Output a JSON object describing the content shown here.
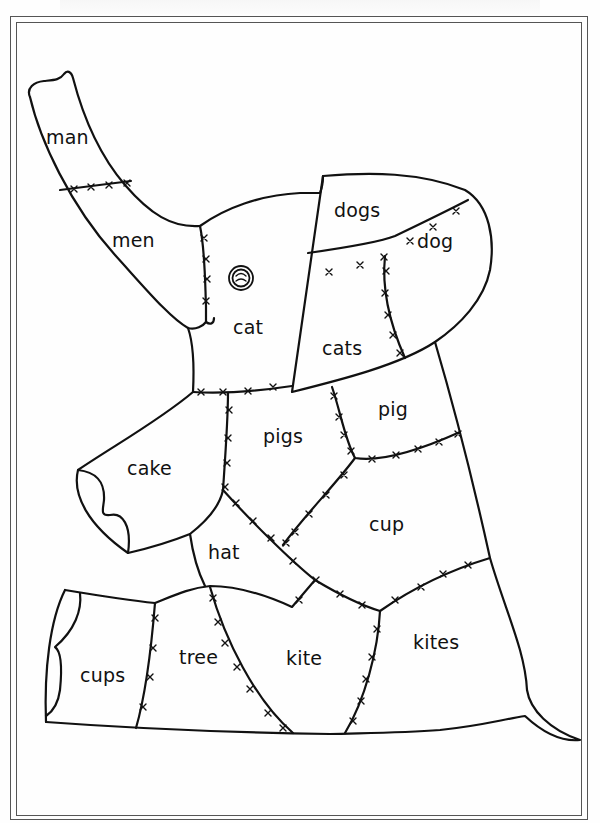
{
  "worksheet": {
    "title": "Patchwork elephant coloring worksheet",
    "figure": "elephant",
    "ink_color": "#111111",
    "paper_color": "#fefefe",
    "frame_color": "#555555"
  },
  "patches": [
    {
      "id": "trunk-tip",
      "word": "man",
      "x": 46,
      "y": 128
    },
    {
      "id": "trunk",
      "word": "men",
      "x": 112,
      "y": 231
    },
    {
      "id": "head",
      "word": "cat",
      "x": 233,
      "y": 318
    },
    {
      "id": "ear-top",
      "word": "dogs",
      "x": 334,
      "y": 201
    },
    {
      "id": "ear-right",
      "word": "dog",
      "x": 417,
      "y": 232
    },
    {
      "id": "ear-bottom",
      "word": "cats",
      "x": 322,
      "y": 339
    },
    {
      "id": "shoulder-right",
      "word": "pig",
      "x": 378,
      "y": 400
    },
    {
      "id": "chest",
      "word": "pigs",
      "x": 263,
      "y": 427
    },
    {
      "id": "front-leg",
      "word": "cake",
      "x": 127,
      "y": 459
    },
    {
      "id": "belly",
      "word": "cup",
      "x": 369,
      "y": 515
    },
    {
      "id": "lower-chest",
      "word": "hat",
      "x": 208,
      "y": 543
    },
    {
      "id": "back-foot",
      "word": "cups",
      "x": 80,
      "y": 666
    },
    {
      "id": "back-leg",
      "word": "tree",
      "x": 179,
      "y": 648
    },
    {
      "id": "lower-body",
      "word": "kite",
      "x": 286,
      "y": 649
    },
    {
      "id": "rump",
      "word": "kites",
      "x": 413,
      "y": 633
    }
  ]
}
